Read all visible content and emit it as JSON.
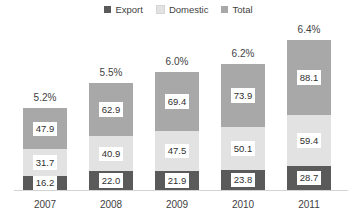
{
  "chart_data": {
    "type": "bar",
    "subtype": "stacked-column",
    "title": "",
    "xlabel": "",
    "ylabel": "",
    "categories": [
      "2007",
      "2008",
      "2009",
      "2010",
      "2011"
    ],
    "series": [
      {
        "name": "Export",
        "color": "#5a5a5a",
        "values": [
          16.2,
          22.0,
          21.9,
          23.8,
          28.7
        ]
      },
      {
        "name": "Domestic",
        "color": "#e2e2e2",
        "values": [
          31.7,
          40.9,
          47.5,
          50.1,
          59.4
        ]
      },
      {
        "name": "Total",
        "color": "#a8a8a8",
        "values": [
          47.9,
          62.9,
          69.4,
          73.9,
          88.1
        ]
      }
    ],
    "annotations": [
      "5.2%",
      "5.5%",
      "6.0%",
      "6.2%",
      "6.4%"
    ],
    "stack_totals": [
      95.8,
      125.8,
      138.8,
      147.8,
      176.2
    ],
    "ylim": [
      0,
      176.2
    ],
    "grid": false,
    "legend_position": "top-center",
    "value_labels": true
  },
  "legend": {
    "items": [
      {
        "label": "Export",
        "color": "#5a5a5a"
      },
      {
        "label": "Domestic",
        "color": "#e2e2e2"
      },
      {
        "label": "Total",
        "color": "#a8a8a8"
      }
    ]
  },
  "bars": [
    {
      "category": "2007",
      "pct": "5.2%",
      "segments": [
        {
          "series": "Export",
          "value": "16.2"
        },
        {
          "series": "Domestic",
          "value": "31.7"
        },
        {
          "series": "Total",
          "value": "47.9"
        }
      ]
    },
    {
      "category": "2008",
      "pct": "5.5%",
      "segments": [
        {
          "series": "Export",
          "value": "22.0"
        },
        {
          "series": "Domestic",
          "value": "40.9"
        },
        {
          "series": "Total",
          "value": "62.9"
        }
      ]
    },
    {
      "category": "2009",
      "pct": "6.0%",
      "segments": [
        {
          "series": "Export",
          "value": "21.9"
        },
        {
          "series": "Domestic",
          "value": "47.5"
        },
        {
          "series": "Total",
          "value": "69.4"
        }
      ]
    },
    {
      "category": "2010",
      "pct": "6.2%",
      "segments": [
        {
          "series": "Export",
          "value": "23.8"
        },
        {
          "series": "Domestic",
          "value": "50.1"
        },
        {
          "series": "Total",
          "value": "73.9"
        }
      ]
    },
    {
      "category": "2011",
      "pct": "6.4%",
      "segments": [
        {
          "series": "Export",
          "value": "28.7"
        },
        {
          "series": "Domestic",
          "value": "59.4"
        },
        {
          "series": "Total",
          "value": "88.1"
        }
      ]
    }
  ]
}
